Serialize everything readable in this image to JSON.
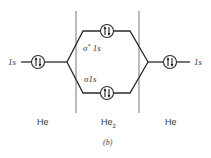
{
  "diagram": {
    "type": "molecular-orbital-energy-diagram",
    "caption": "(b)",
    "columns": {
      "left": "He",
      "center_main": "He",
      "center_sub": "2",
      "right": "He"
    },
    "atomic_orbitals": {
      "left": {
        "label": "1s",
        "electrons": "up-down pair"
      },
      "right": {
        "label": "1s",
        "electrons": "up-down pair"
      }
    },
    "molecular_orbitals": {
      "antibonding": {
        "label_sigma": "σ",
        "label_star": "*",
        "label_rest": " 1s",
        "electrons": "up-down pair"
      },
      "bonding": {
        "label_sigma": "σ",
        "label_rest": "1s",
        "electrons": "up-down pair"
      }
    },
    "colors": {
      "line": "#2a2a2a",
      "text": "#333333",
      "background": "#ffffff"
    }
  }
}
